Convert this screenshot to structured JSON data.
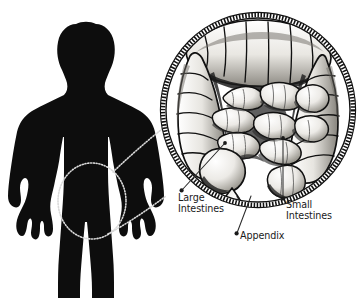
{
  "figure": {
    "background_color": "#ffffff",
    "silhouette_color": "#0d0d0d",
    "label_color": "#1a1a1a",
    "line_color": "#2b2b2b",
    "inset": {
      "name": "magnified-intestines-inset",
      "shape": "circle",
      "center_x": 258,
      "center_y": 110,
      "radius": 96,
      "border_style": "beaded-dotted-ring"
    },
    "callout_circle": {
      "name": "abdomen-focus-circle",
      "center_x": 92,
      "center_y": 201,
      "radius_x": 34,
      "radius_y": 38,
      "style": "dotted"
    }
  },
  "labels": {
    "large_intestines": {
      "line1": "Large",
      "line2": "Intestines"
    },
    "appendix": {
      "line1": "Appendix"
    },
    "small_intestines": {
      "line1": "Small",
      "line2": "Intestines"
    }
  }
}
